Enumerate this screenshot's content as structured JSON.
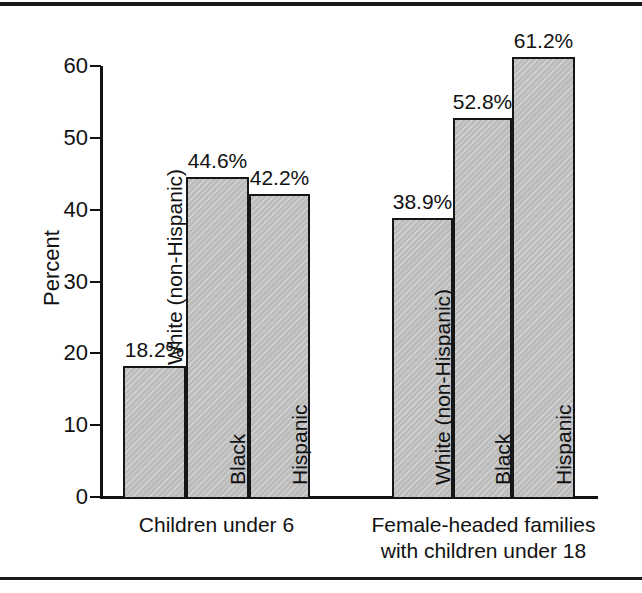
{
  "chart_data": {
    "type": "bar",
    "title": "",
    "subtitle": "",
    "xlabel": "",
    "ylabel": "Percent",
    "ylim": [
      0,
      60
    ],
    "yticks": [
      "0",
      "10",
      "20",
      "30",
      "40",
      "50",
      "60"
    ],
    "grid": false,
    "legend": "none",
    "value_suffix": "%",
    "groups": [
      {
        "caption_line1": "Children under 6",
        "caption_line2": "",
        "bars": [
          {
            "series": "White (non-Hispanic)",
            "value": 18.2,
            "value_label": "18.2%"
          },
          {
            "series": "Black",
            "value": 44.6,
            "value_label": "44.6%"
          },
          {
            "series": "Hispanic",
            "value": 42.2,
            "value_label": "42.2%"
          }
        ]
      },
      {
        "caption_line1": "Female-headed families",
        "caption_line2": "with children under 18",
        "bars": [
          {
            "series": "White (non-Hispanic)",
            "value": 38.9,
            "value_label": "38.9%"
          },
          {
            "series": "Black",
            "value": 52.8,
            "value_label": "52.8%"
          },
          {
            "series": "Hispanic",
            "value": 61.2,
            "value_label": "61.2%"
          }
        ]
      }
    ],
    "categories": [
      "Children under 6",
      "Female-headed families with children under 18"
    ],
    "series": [
      {
        "name": "White (non-Hispanic)",
        "values": [
          18.2,
          38.9
        ]
      },
      {
        "name": "Black",
        "values": [
          44.6,
          52.8
        ]
      },
      {
        "name": "Hispanic",
        "values": [
          42.2,
          61.2
        ]
      }
    ],
    "colors": {
      "bar_fill": "#bcbcbc",
      "bar_stroke": "#161616",
      "axis": "#111111",
      "background": "#ffffff"
    }
  }
}
